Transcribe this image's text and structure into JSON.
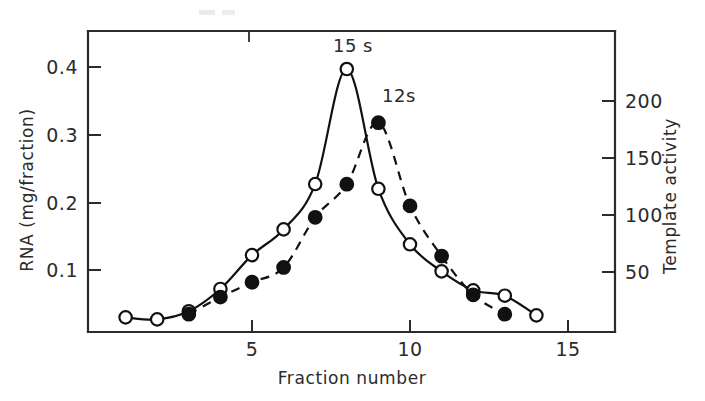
{
  "chart_data": {
    "type": "line",
    "title": "",
    "xlabel": "Fraction number",
    "ylabel": "RNA (mg/fraction)",
    "y2label": "Template activity",
    "xlim": [
      0.3,
      15.6
    ],
    "ylim": [
      0,
      0.445
    ],
    "y2lim": [
      0,
      260
    ],
    "grid": false,
    "legend_position": "none",
    "xticks": [
      5,
      10,
      15
    ],
    "xticklabels": [
      "5",
      "10",
      "15"
    ],
    "yticks": [
      0.1,
      0.2,
      0.3,
      0.4
    ],
    "yticklabels": [
      "0.1",
      "0.2",
      "0.3",
      "0.4"
    ],
    "y2ticks": [
      50,
      100,
      150,
      200
    ],
    "y2ticklabels": [
      "50",
      "100",
      "150",
      "200"
    ],
    "annotations": [
      {
        "text": "15 s",
        "x": 8,
        "y": 0.425,
        "marker": "open-circle-peak"
      },
      {
        "text": "12s",
        "x": 9.35,
        "y": 0.375,
        "marker": "filled-circle-peak"
      }
    ],
    "series": [
      {
        "name": "RNA (mg/fraction)",
        "axis": "left",
        "marker": "open-circle",
        "linestyle": "solid",
        "x": [
          1,
          2,
          3,
          4,
          5,
          6,
          7,
          8,
          9,
          10,
          11,
          12,
          13,
          14
        ],
        "values": [
          0.03,
          0.027,
          0.039,
          0.072,
          0.122,
          0.16,
          0.227,
          0.397,
          0.22,
          0.138,
          0.098,
          0.07,
          0.062,
          0.033
        ]
      },
      {
        "name": "Template activity",
        "axis": "right",
        "marker": "filled-circle",
        "linestyle": "dashed",
        "x": [
          3,
          4,
          5,
          6,
          7,
          8,
          9,
          10,
          11,
          12,
          13
        ],
        "values": [
          13,
          28,
          41,
          54,
          98,
          127,
          181,
          108,
          64,
          30,
          13
        ]
      }
    ]
  },
  "axes": {
    "x_title": "Fraction number",
    "y_left_title": "RNA (mg/fraction)",
    "y_right_title": "Template activity"
  },
  "labels": {
    "peak_15s": "15 s",
    "peak_12s": "12s",
    "x_tick_5": "5",
    "x_tick_10": "10",
    "x_tick_15": "15",
    "y_tick_01": "0.1",
    "y_tick_02": "0.2",
    "y_tick_03": "0.3",
    "y_tick_04": "0.4",
    "y2_tick_50": "50",
    "y2_tick_100": "100",
    "y2_tick_150": "150",
    "y2_tick_200": "200"
  },
  "colors": {
    "ink": "#111111",
    "axis": "#2b2b2b",
    "background": "#ffffff"
  }
}
